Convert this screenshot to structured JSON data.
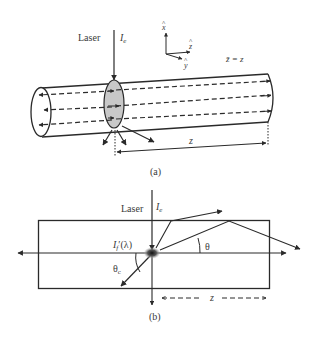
{
  "figure_a": {
    "laser_label": "Laser",
    "intensity_label": "I",
    "intensity_sub": "e",
    "axis_x": "x",
    "axis_y": "y",
    "axis_z": "z",
    "axis_hat": "^",
    "zbar_label": "z̄ = z",
    "distance_label": "z",
    "caption": "(a)"
  },
  "figure_b": {
    "laser_label": "Laser",
    "intensity_label": "I",
    "intensity_sub": "e",
    "fluor_label": "I",
    "fluor_sub": "f",
    "fluor_suffix": "′(λ)",
    "theta_label": "θ",
    "theta_c_label": "θ",
    "theta_c_sub": "c",
    "distance_label": "z",
    "caption": "(b)"
  },
  "colors": {
    "stroke": "#2a2a2a",
    "fill_section": "#c8c8c8",
    "text": "#3a3a3a"
  }
}
